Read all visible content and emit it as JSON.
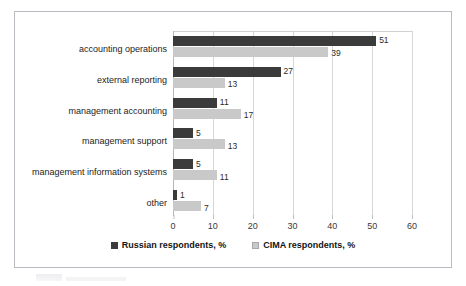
{
  "chart_data": {
    "type": "bar",
    "orientation": "horizontal",
    "title": "",
    "xlabel": "",
    "ylabel": "",
    "xlim": [
      0,
      60
    ],
    "xticks": [
      0,
      10,
      20,
      30,
      40,
      50,
      60
    ],
    "grid": true,
    "legend_position": "bottom",
    "categories": [
      "accounting operations",
      "external reporting",
      "management accounting",
      "management support",
      "management information systems",
      "other"
    ],
    "series": [
      {
        "name": "Russian respondents, %",
        "color": "#3b3b3b",
        "values": [
          51,
          27,
          11,
          5,
          5,
          1
        ]
      },
      {
        "name": "CIMA respondents, %",
        "color": "#c9c9c9",
        "values": [
          39,
          13,
          17,
          13,
          11,
          7
        ]
      }
    ]
  },
  "legend": {
    "items": [
      {
        "label": "Russian respondents, %",
        "swatch": "dark"
      },
      {
        "label": "CIMA respondents, %",
        "swatch": "light"
      }
    ]
  }
}
